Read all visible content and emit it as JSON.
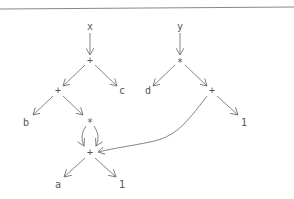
{
  "diagram": {
    "type": "expression-dag",
    "nodes": [
      {
        "id": "x",
        "label": "x",
        "x": 90,
        "y": 27
      },
      {
        "id": "plus1",
        "label": "+",
        "x": 90,
        "y": 61
      },
      {
        "id": "y",
        "label": "y",
        "x": 180,
        "y": 27
      },
      {
        "id": "star1",
        "label": "*",
        "x": 180,
        "y": 61
      },
      {
        "id": "plus2",
        "label": "+",
        "x": 58,
        "y": 91
      },
      {
        "id": "c",
        "label": "c",
        "x": 122,
        "y": 91
      },
      {
        "id": "d",
        "label": "d",
        "x": 148,
        "y": 91
      },
      {
        "id": "plus3",
        "label": "+",
        "x": 212,
        "y": 91
      },
      {
        "id": "b",
        "label": "b",
        "x": 26,
        "y": 123
      },
      {
        "id": "star2",
        "label": "*",
        "x": 90,
        "y": 121
      },
      {
        "id": "one1",
        "label": "1",
        "x": 244,
        "y": 123
      },
      {
        "id": "plus4",
        "label": "+",
        "x": 90,
        "y": 153
      },
      {
        "id": "a",
        "label": "a",
        "x": 58,
        "y": 185
      },
      {
        "id": "one2",
        "label": "1",
        "x": 122,
        "y": 185
      }
    ],
    "edges": [
      {
        "from": "x",
        "to": "plus1"
      },
      {
        "from": "plus1",
        "to": "plus2"
      },
      {
        "from": "plus1",
        "to": "c"
      },
      {
        "from": "y",
        "to": "star1"
      },
      {
        "from": "star1",
        "to": "d"
      },
      {
        "from": "star1",
        "to": "plus3"
      },
      {
        "from": "plus2",
        "to": "b"
      },
      {
        "from": "plus2",
        "to": "star2"
      },
      {
        "from": "plus3",
        "to": "one1"
      },
      {
        "from": "star2",
        "to": "plus4",
        "curve": "left"
      },
      {
        "from": "star2",
        "to": "plus4",
        "curve": "right"
      },
      {
        "from": "plus3",
        "to": "plus4",
        "curve": "long"
      },
      {
        "from": "plus4",
        "to": "a"
      },
      {
        "from": "plus4",
        "to": "one2"
      }
    ]
  }
}
